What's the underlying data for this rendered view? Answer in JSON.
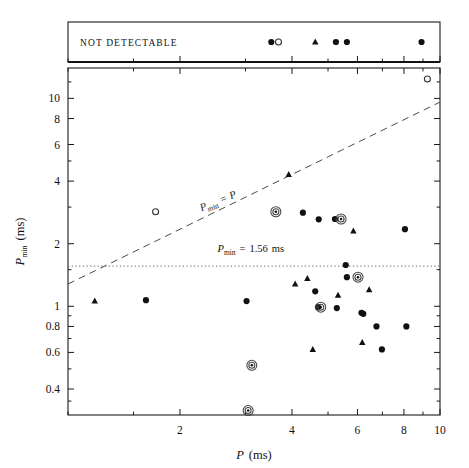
{
  "figure": {
    "background": "#ffffff",
    "ink_color": "#111111",
    "plot_box": {
      "left": 68,
      "top": 68,
      "right": 440,
      "bottom": 415
    },
    "band_box": {
      "left": 68,
      "top": 22,
      "right": 440,
      "bottom": 62
    },
    "band_label": "NOT DETECTABLE"
  },
  "chart_data": {
    "type": "scatter",
    "title": "",
    "xlabel": "P (ms)",
    "ylabel": "P_min (ms)",
    "xlabel_symbol": "P",
    "xlabel_units": "(ms)",
    "ylabel_symbol": "P",
    "ylabel_subscript": "min",
    "ylabel_units": "(ms)",
    "xscale": "log",
    "yscale": "log",
    "xlim": [
      1.0,
      10.0
    ],
    "ylim": [
      0.3,
      14.0
    ],
    "grid": false,
    "legend": null,
    "xticks": [
      2,
      4,
      6,
      8,
      10
    ],
    "xticklabels": [
      "2",
      "4",
      "6",
      "8",
      "10"
    ],
    "xticks_minor": [
      1,
      1.5,
      3,
      5,
      7,
      9
    ],
    "yticks": [
      10,
      8,
      6,
      4,
      2,
      1,
      0.8,
      0.6,
      0.4
    ],
    "yticklabels": [
      "10",
      "8",
      "6",
      "4",
      "2",
      "1",
      "0.8",
      "0.6",
      "0.4"
    ],
    "yticks_minor": [
      12,
      5,
      3,
      1.5,
      0.9,
      0.7,
      0.5,
      0.35
    ],
    "annotations": [
      {
        "name": "identity-line-label",
        "text": "P_min = P",
        "text_parts": {
          "sym1": "P",
          "sub1": "min",
          "op": "=",
          "sym2": "P"
        },
        "x": 2.55,
        "y": 3.1,
        "rotation": -22
      },
      {
        "name": "threshold-line-label",
        "text": "P_min = 1.56 ms",
        "text_parts": {
          "sym1": "P",
          "sub1": "min",
          "op": "=",
          "val": "1.56",
          "units": "ms"
        },
        "x": 3.1,
        "y": 1.82,
        "rotation": 0
      }
    ],
    "lines": [
      {
        "name": "identity-line",
        "label": "P_min = P",
        "style": "dashed",
        "type": "identity",
        "x": [
          1.0,
          10.0
        ],
        "y": [
          1.28,
          9.6
        ]
      },
      {
        "name": "threshold-line",
        "label": "P_min = 1.56 ms",
        "style": "dotted",
        "type": "horizontal",
        "value": 1.56,
        "x": [
          1.0,
          10.0
        ],
        "y": [
          1.56,
          1.56
        ]
      }
    ],
    "series": [
      {
        "name": "detections-filled",
        "marker": "filled-circle",
        "points": [
          {
            "x": 1.62,
            "y": 1.07
          },
          {
            "x": 3.02,
            "y": 1.06
          },
          {
            "x": 4.28,
            "y": 2.82
          },
          {
            "x": 4.72,
            "y": 2.62
          },
          {
            "x": 4.62,
            "y": 1.18
          },
          {
            "x": 4.7,
            "y": 0.99
          },
          {
            "x": 5.22,
            "y": 2.63
          },
          {
            "x": 5.28,
            "y": 0.98
          },
          {
            "x": 5.58,
            "y": 1.58
          },
          {
            "x": 5.62,
            "y": 1.38
          },
          {
            "x": 6.15,
            "y": 0.93
          },
          {
            "x": 6.22,
            "y": 0.92
          },
          {
            "x": 6.75,
            "y": 0.8
          },
          {
            "x": 6.98,
            "y": 0.62
          },
          {
            "x": 8.05,
            "y": 2.35
          },
          {
            "x": 8.12,
            "y": 0.8
          }
        ]
      },
      {
        "name": "detections-triangle",
        "marker": "triangle",
        "points": [
          {
            "x": 1.18,
            "y": 1.06
          },
          {
            "x": 3.92,
            "y": 4.3
          },
          {
            "x": 4.08,
            "y": 1.28
          },
          {
            "x": 4.4,
            "y": 1.36
          },
          {
            "x": 5.32,
            "y": 1.13
          },
          {
            "x": 5.85,
            "y": 2.3
          },
          {
            "x": 6.45,
            "y": 1.2
          },
          {
            "x": 6.18,
            "y": 0.67
          },
          {
            "x": 4.55,
            "y": 0.62
          }
        ]
      },
      {
        "name": "detections-circled",
        "marker": "circled-dot",
        "points": [
          {
            "x": 3.62,
            "y": 2.85
          },
          {
            "x": 5.42,
            "y": 2.63
          },
          {
            "x": 4.78,
            "y": 0.99
          },
          {
            "x": 6.02,
            "y": 1.38
          },
          {
            "x": 3.12,
            "y": 0.52
          },
          {
            "x": 3.05,
            "y": 0.315
          }
        ]
      },
      {
        "name": "upper-limits-open",
        "marker": "open-circle",
        "points": [
          {
            "x": 1.72,
            "y": 2.85
          },
          {
            "x": 9.25,
            "y": 12.4
          }
        ]
      }
    ],
    "not_detectable_band": {
      "label": "NOT DETECTABLE",
      "markers": [
        {
          "x": 3.52,
          "marker": "filled-circle"
        },
        {
          "x": 3.68,
          "marker": "open-circle"
        },
        {
          "x": 4.62,
          "marker": "triangle"
        },
        {
          "x": 5.25,
          "marker": "filled-circle"
        },
        {
          "x": 5.62,
          "marker": "filled-circle"
        },
        {
          "x": 8.92,
          "marker": "filled-circle"
        }
      ]
    }
  }
}
